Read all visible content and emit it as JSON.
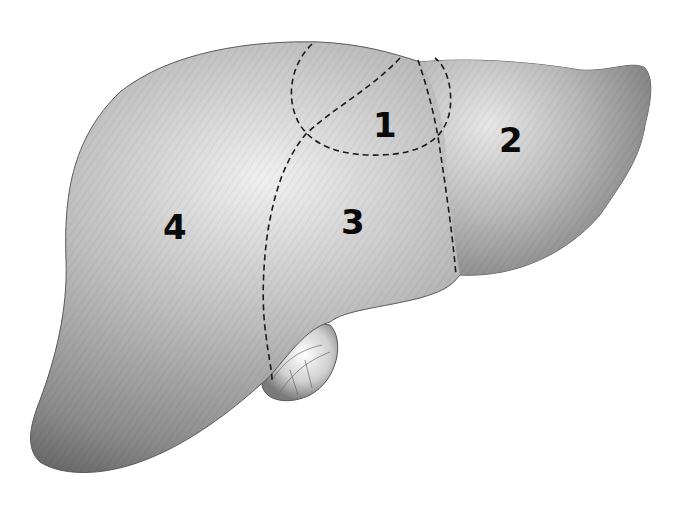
{
  "diagram": {
    "regions": [
      {
        "id": "region-1",
        "label": "1"
      },
      {
        "id": "region-2",
        "label": "2"
      },
      {
        "id": "region-3",
        "label": "3"
      },
      {
        "id": "region-4",
        "label": "4"
      }
    ],
    "structures": [
      "liver",
      "gallbladder"
    ],
    "colors": {
      "background": "#ffffff",
      "organ_light": "#e6e6e6",
      "organ_mid": "#a8a8a8",
      "organ_dark": "#6e6e6e",
      "boundary_line": "#1a1a1a",
      "label": "#0a0a0a"
    }
  }
}
